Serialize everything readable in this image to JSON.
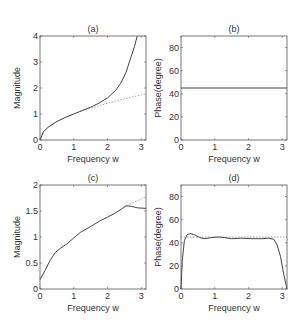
{
  "figure": {
    "background": "#ffffff",
    "axis_color": "#555555",
    "line_color": "#444444",
    "dotted_color": "#999999"
  },
  "chart_data": [
    {
      "id": "a",
      "type": "line",
      "title": "(a)",
      "xlabel": "Frequency w",
      "ylabel": "Magnitude",
      "xlim": [
        0,
        3.1416
      ],
      "ylim": [
        0,
        4
      ],
      "xticks": [
        "0",
        "1",
        "2",
        "3"
      ],
      "yticks": [
        "0",
        "1",
        "2",
        "3",
        "4"
      ],
      "xtick_values": [
        0,
        1,
        2,
        3
      ],
      "ytick_values": [
        0,
        1,
        2,
        3,
        4
      ],
      "grid": false,
      "series": [
        {
          "name": "ideal",
          "style": "dotted",
          "x": [
            0,
            0.1,
            0.25,
            0.5,
            0.75,
            1.0,
            1.25,
            1.5,
            1.75,
            2.0,
            2.25,
            2.5,
            2.75,
            3.0,
            3.1416
          ],
          "y": [
            0,
            0.32,
            0.5,
            0.71,
            0.87,
            1.0,
            1.12,
            1.22,
            1.32,
            1.41,
            1.5,
            1.58,
            1.66,
            1.73,
            1.77
          ]
        },
        {
          "name": "approximation",
          "style": "solid",
          "x": [
            0,
            0.1,
            0.25,
            0.5,
            0.75,
            1.0,
            1.25,
            1.5,
            1.75,
            2.0,
            2.25,
            2.4,
            2.55,
            2.7,
            2.8,
            2.88
          ],
          "y": [
            0,
            0.32,
            0.5,
            0.71,
            0.87,
            1.0,
            1.13,
            1.26,
            1.42,
            1.62,
            1.92,
            2.2,
            2.6,
            3.2,
            3.6,
            4.0
          ]
        }
      ]
    },
    {
      "id": "b",
      "type": "line",
      "title": "(b)",
      "xlabel": "Frequency w",
      "ylabel": "Phase(degree)",
      "xlim": [
        0,
        3.1416
      ],
      "ylim": [
        0,
        90
      ],
      "xticks": [
        "0",
        "1",
        "2",
        "3"
      ],
      "yticks": [
        "0",
        "20",
        "40",
        "60",
        "80"
      ],
      "xtick_values": [
        0,
        1,
        2,
        3
      ],
      "ytick_values": [
        0,
        20,
        40,
        60,
        80
      ],
      "grid": false,
      "series": [
        {
          "name": "phase",
          "style": "solid",
          "x": [
            0,
            3.1416
          ],
          "y": [
            45,
            45
          ]
        }
      ]
    },
    {
      "id": "c",
      "type": "line",
      "title": "(c)",
      "xlabel": "Frequency w",
      "ylabel": "Magnitude",
      "xlim": [
        0,
        3.1416
      ],
      "ylim": [
        0,
        2
      ],
      "xticks": [
        "0",
        "1",
        "2",
        "3"
      ],
      "yticks": [
        "0",
        "0.5",
        "1",
        "1.5",
        "2"
      ],
      "xtick_values": [
        0,
        1,
        2,
        3
      ],
      "ytick_values": [
        0,
        0.5,
        1,
        1.5,
        2
      ],
      "grid": false,
      "series": [
        {
          "name": "ideal",
          "style": "dotted",
          "x": [
            2.5,
            2.75,
            3.0,
            3.1416
          ],
          "y": [
            1.58,
            1.66,
            1.73,
            1.77
          ]
        },
        {
          "name": "approximation",
          "style": "solid",
          "x": [
            0,
            0.15,
            0.3,
            0.45,
            0.6,
            0.8,
            1.0,
            1.2,
            1.5,
            1.8,
            2.0,
            2.2,
            2.4,
            2.55,
            2.7,
            2.9,
            3.1416
          ],
          "y": [
            0.18,
            0.36,
            0.55,
            0.7,
            0.78,
            0.87,
            0.98,
            1.09,
            1.2,
            1.32,
            1.38,
            1.45,
            1.53,
            1.6,
            1.59,
            1.56,
            1.55
          ]
        }
      ]
    },
    {
      "id": "d",
      "type": "line",
      "title": "(d)",
      "xlabel": "Frequency w",
      "ylabel": "Phase(degree)",
      "xlim": [
        0,
        3.1416
      ],
      "ylim": [
        0,
        90
      ],
      "xticks": [
        "0",
        "1",
        "2",
        "3"
      ],
      "yticks": [
        "0",
        "20",
        "40",
        "60",
        "80"
      ],
      "xtick_values": [
        0,
        1,
        2,
        3
      ],
      "ytick_values": [
        0,
        20,
        40,
        60,
        80
      ],
      "grid": false,
      "series": [
        {
          "name": "ideal",
          "style": "dotted",
          "x": [
            0,
            3.1416
          ],
          "y": [
            45,
            45
          ]
        },
        {
          "name": "phase",
          "style": "solid",
          "x": [
            0,
            0.04,
            0.1,
            0.18,
            0.28,
            0.4,
            0.55,
            0.7,
            0.9,
            1.1,
            1.3,
            1.5,
            1.8,
            2.1,
            2.4,
            2.6,
            2.75,
            2.85,
            2.95,
            3.05,
            3.1416
          ],
          "y": [
            0,
            25,
            42,
            47,
            48,
            47,
            44.5,
            43.5,
            44.5,
            45,
            44.5,
            43.5,
            44,
            43.5,
            43.5,
            44,
            43,
            38,
            28,
            12,
            0
          ]
        }
      ]
    }
  ]
}
